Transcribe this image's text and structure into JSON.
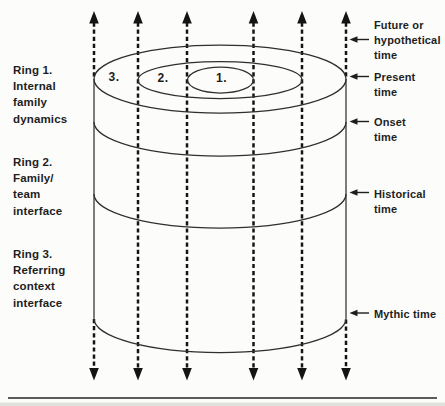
{
  "colors": {
    "ink": "#1e1e1e",
    "line": "#2f2f2f",
    "arrow": "#141414",
    "background": "#fcfcfa",
    "rule": "#262626",
    "scanedge": "#c9c9c4"
  },
  "left_labels": [
    {
      "lines": [
        "Ring 1.",
        "Internal",
        "family",
        "dynamics"
      ]
    },
    {
      "lines": [
        "Ring 2.",
        "Family/",
        "team",
        "interface"
      ]
    },
    {
      "lines": [
        "Ring 3.",
        "Referring",
        "context",
        "interface"
      ]
    }
  ],
  "ring_numbers": [
    "3.",
    "2.",
    "1."
  ],
  "time_labels": [
    {
      "lines": [
        "Future or",
        "hypothetical",
        "time"
      ]
    },
    {
      "lines": [
        "Present",
        "time"
      ]
    },
    {
      "lines": [
        "Onset",
        "time"
      ]
    },
    {
      "lines": [
        "Historical",
        "time"
      ]
    },
    {
      "lines": [
        "Mythic time"
      ]
    }
  ]
}
